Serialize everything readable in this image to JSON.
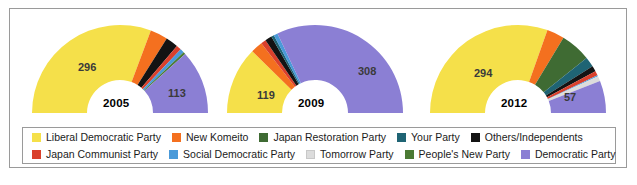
{
  "chart_data": {
    "type": "pie",
    "title": "",
    "subtitle": "",
    "variant": "half-donut-seat-diagram",
    "legend_position": "bottom",
    "parties": [
      {
        "key": "ldp",
        "label": "Liberal Democratic Party",
        "color": "#f5e04a"
      },
      {
        "key": "nk",
        "label": "New Komeito",
        "color": "#f4701f"
      },
      {
        "key": "jrp",
        "label": "Japan Restoration Party",
        "color": "#3f6b33"
      },
      {
        "key": "yp",
        "label": "Your Party",
        "color": "#1f6474"
      },
      {
        "key": "oth",
        "label": "Others/Independents",
        "color": "#131313"
      },
      {
        "key": "jcp",
        "label": "Japan Communist Party",
        "color": "#d9402c"
      },
      {
        "key": "sdp",
        "label": "Social Democratic Party",
        "color": "#4a9ad9"
      },
      {
        "key": "tp",
        "label": "Tomorrow Party",
        "color": "#dcdcdc"
      },
      {
        "key": "pnp",
        "label": "People's New Party",
        "color": "#4b7a34"
      },
      {
        "key": "dpj",
        "label": "Democratic Party",
        "color": "#8b7fd4"
      }
    ],
    "charts": [
      {
        "year": "2005",
        "center_label": "2005",
        "total": 480,
        "segments": [
          {
            "key": "ldp",
            "value": 296,
            "label": "296",
            "show_label": true
          },
          {
            "key": "nk",
            "value": 31,
            "label": "31",
            "show_label": false
          },
          {
            "key": "oth",
            "value": 22,
            "label": "22",
            "show_label": false
          },
          {
            "key": "jcp",
            "value": 9,
            "label": "9",
            "show_label": false
          },
          {
            "key": "sdp",
            "value": 7,
            "label": "7",
            "show_label": false
          },
          {
            "key": "pnp",
            "value": 4,
            "label": "4",
            "show_label": false
          },
          {
            "key": "dpj",
            "value": 113,
            "label": "113",
            "show_label": true
          }
        ]
      },
      {
        "year": "2009",
        "center_label": "2009",
        "total": 480,
        "segments": [
          {
            "key": "ldp",
            "value": 119,
            "label": "119",
            "show_label": true
          },
          {
            "key": "nk",
            "value": 21,
            "label": "21",
            "show_label": false
          },
          {
            "key": "jcp",
            "value": 9,
            "label": "9",
            "show_label": false
          },
          {
            "key": "oth",
            "value": 12,
            "label": "12",
            "show_label": false
          },
          {
            "key": "yp",
            "value": 5,
            "label": "5",
            "show_label": false
          },
          {
            "key": "sdp",
            "value": 7,
            "label": "7",
            "show_label": false
          },
          {
            "key": "dpj",
            "value": 308,
            "label": "308",
            "show_label": true
          }
        ]
      },
      {
        "year": "2012",
        "center_label": "2012",
        "total": 480,
        "segments": [
          {
            "key": "ldp",
            "value": 294,
            "label": "294",
            "show_label": true
          },
          {
            "key": "nk",
            "value": 31,
            "label": "31",
            "show_label": false
          },
          {
            "key": "jrp",
            "value": 54,
            "label": "54",
            "show_label": false
          },
          {
            "key": "yp",
            "value": 18,
            "label": "18",
            "show_label": false
          },
          {
            "key": "oth",
            "value": 10,
            "label": "10",
            "show_label": false
          },
          {
            "key": "jcp",
            "value": 8,
            "label": "8",
            "show_label": false
          },
          {
            "key": "sdp",
            "value": 2,
            "label": "2",
            "show_label": false
          },
          {
            "key": "tp",
            "value": 9,
            "label": "9",
            "show_label": false
          },
          {
            "key": "dpj",
            "value": 57,
            "label": "57",
            "show_label": true
          }
        ]
      }
    ]
  },
  "legend": {
    "row1": [
      {
        "label": "Liberal Democratic Party",
        "color": "#f5e04a"
      },
      {
        "label": "New Komeito",
        "color": "#f4701f"
      },
      {
        "label": "Japan Restoration Party",
        "color": "#3f6b33"
      },
      {
        "label": "Your Party",
        "color": "#1f6474"
      },
      {
        "label": "Others/Independents",
        "color": "#131313"
      }
    ],
    "row2": [
      {
        "label": "Japan Communist Party",
        "color": "#d9402c"
      },
      {
        "label": "Social Democratic Party",
        "color": "#4a9ad9"
      },
      {
        "label": "Tomorrow Party",
        "color": "#dcdcdc"
      },
      {
        "label": "People's New Party",
        "color": "#4b7a34"
      },
      {
        "label": "Democratic Party",
        "color": "#8b7fd4"
      }
    ]
  }
}
